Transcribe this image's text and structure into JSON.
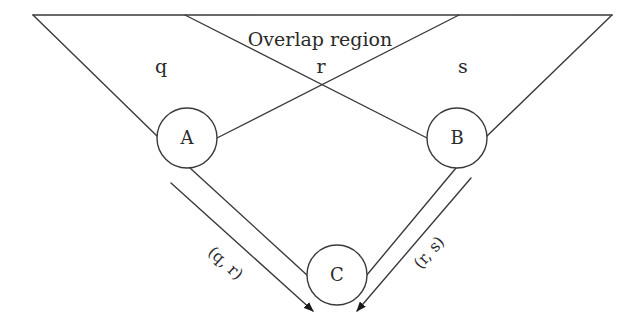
{
  "diagram": {
    "title_label": "Overlap region",
    "regions": {
      "left": "q",
      "overlap": "r",
      "right": "s"
    },
    "nodes": {
      "a": "A",
      "b": "B",
      "c": "C"
    },
    "edges": {
      "a_to_c": "(q, r)",
      "b_to_c": "(r, s)"
    },
    "colors": {
      "stroke": "#3a3a3a",
      "text": "#2a2a2a",
      "background": "#ffffff"
    }
  }
}
